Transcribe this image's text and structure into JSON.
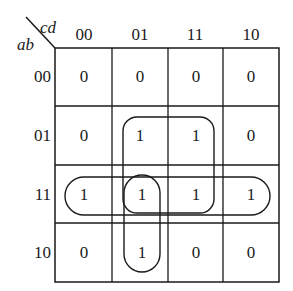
{
  "kmap": {
    "row_var": "ab",
    "col_var": "cd",
    "col_labels": [
      "00",
      "01",
      "11",
      "10"
    ],
    "row_labels": [
      "00",
      "01",
      "11",
      "10"
    ],
    "cells": [
      [
        "0",
        "0",
        "0",
        "0"
      ],
      [
        "0",
        "1",
        "1",
        "0"
      ],
      [
        "1",
        "1",
        "1",
        "1"
      ],
      [
        "0",
        "1",
        "0",
        "0"
      ]
    ],
    "groups": [
      {
        "name": "quad-rows01-11-cols01-11",
        "rows": [
          "01",
          "11"
        ],
        "cols": [
          "01",
          "11"
        ]
      },
      {
        "name": "row-11-all",
        "rows": [
          "11"
        ],
        "cols": [
          "00",
          "01",
          "11",
          "10"
        ]
      },
      {
        "name": "col-01-rows11-10",
        "rows": [
          "11",
          "10"
        ],
        "cols": [
          "01"
        ]
      }
    ],
    "colors": {
      "line": "#1a1a1a",
      "background": "#ffffff"
    }
  }
}
